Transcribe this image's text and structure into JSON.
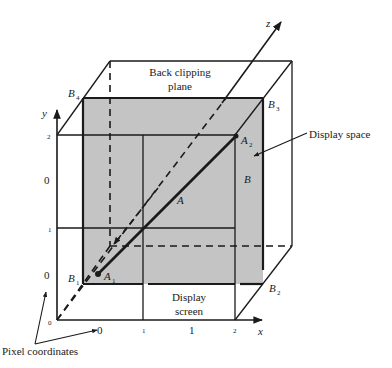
{
  "diagram": {
    "type": "3d-viewing-volume",
    "colors": {
      "background": "#ffffff",
      "line": "#1a1a1a",
      "shaded_plane": "#c4c4c4"
    },
    "labels": {
      "back_clipping_plane_line1": "Back clipping",
      "back_clipping_plane_line2": "plane",
      "display_space": "Display space",
      "display_screen_line1": "Display",
      "display_screen_line2": "screen",
      "pixel_coordinates": "Pixel coordinates"
    },
    "axes": {
      "x": "x",
      "y": "y",
      "z": "z"
    },
    "points": {
      "A": "A",
      "A1": "A",
      "A1_sub": "1",
      "A2": "A",
      "A2_sub": "2",
      "B": "B",
      "B1": "B",
      "B1_sub": "1",
      "B2": "B",
      "B2_sub": "2",
      "B3": "B",
      "B3_sub": "3",
      "B4": "B",
      "B4_sub": "4"
    },
    "ticks": {
      "x_small": [
        "0",
        "1",
        "2"
      ],
      "x_large": [
        "0",
        "1"
      ],
      "y_small": [
        "0",
        "1",
        "2"
      ],
      "y_large": [
        "0",
        "0"
      ]
    }
  }
}
